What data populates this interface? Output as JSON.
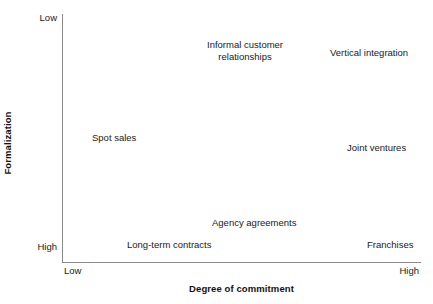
{
  "figure": {
    "background_color": "#ffffff",
    "axis_color": "#8a8a8a",
    "text_color": "#1a1a1a"
  },
  "axes": {
    "y": {
      "title": "Formalization",
      "low_label": "Low",
      "high_label": "High"
    },
    "x": {
      "title": "Degree of commitment",
      "low_label": "Low",
      "high_label": "High"
    }
  },
  "chart_data": {
    "type": "scatter",
    "title": "",
    "subtitle": "",
    "xlabel": "Degree of commitment",
    "ylabel": "Formalization",
    "xlim": [
      "Low",
      "High"
    ],
    "ylim": [
      "Low",
      "High"
    ],
    "x_tick_labels": [
      "Low",
      "High"
    ],
    "y_tick_labels": [
      "Low",
      "High"
    ],
    "grid": false,
    "legend": "none",
    "note": "Y axis is inverted: Low formalization at top, High formalization at bottom. Points are text labels only, no markers.",
    "points": [
      {
        "label": "Informal customer\nrelationships",
        "label_lines": [
          "Informal customer",
          "relationships"
        ],
        "x": 0.4,
        "y": 0.1,
        "x_level": "medium",
        "y_level": "low formalization",
        "px_center_x": 245,
        "px_center_y": 51
      },
      {
        "label": "Vertical integration",
        "label_lines": [
          "Vertical integration"
        ],
        "x": 0.86,
        "y": 0.13,
        "x_level": "high",
        "y_level": "low formalization",
        "px_center_x": 369,
        "px_center_y": 53
      },
      {
        "label": "Spot sales",
        "label_lines": [
          "Spot sales"
        ],
        "x": 0.1,
        "y": 0.52,
        "x_level": "low",
        "y_level": "medium formalization",
        "px_center_x": 114,
        "px_center_y": 138
      },
      {
        "label": "Joint ventures",
        "label_lines": [
          "Joint ventures"
        ],
        "x": 0.86,
        "y": 0.56,
        "x_level": "high",
        "y_level": "medium formalization",
        "px_center_x": 376,
        "px_center_y": 148
      },
      {
        "label": "Agency agreements",
        "label_lines": [
          "Agency agreements"
        ],
        "x": 0.48,
        "y": 0.82,
        "x_level": "medium",
        "y_level": "high formalization",
        "px_center_x": 254,
        "px_center_y": 223
      },
      {
        "label": "Long-term contracts",
        "label_lines": [
          "Long-term contracts"
        ],
        "x": 0.23,
        "y": 0.92,
        "x_level": "low-medium",
        "y_level": "high formalization",
        "px_center_x": 169,
        "px_center_y": 245
      },
      {
        "label": "Franchises",
        "label_lines": [
          "Franchises"
        ],
        "x": 0.91,
        "y": 0.92,
        "x_level": "high",
        "y_level": "high formalization",
        "px_center_x": 390,
        "px_center_y": 245
      }
    ]
  }
}
